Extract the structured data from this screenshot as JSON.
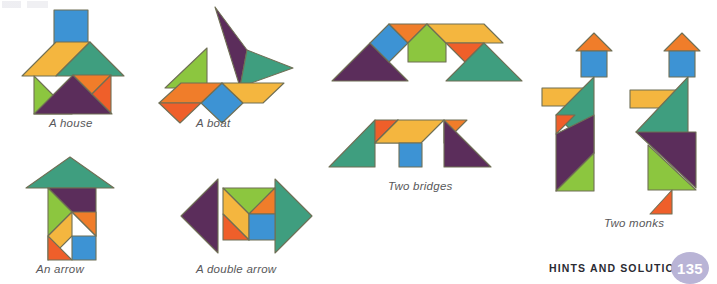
{
  "page": {
    "width": 717,
    "height": 280,
    "background": "#ffffff",
    "footer_label": "HINTS AND SOLUTIONS",
    "page_number": "135",
    "page_badge_color": "#b9b4d6",
    "caption_color": "#58585a"
  },
  "palette": {
    "blue": "#3d93d4",
    "orange": "#f07d2a",
    "orange_dark": "#ef5f2a",
    "yellow": "#f4b63f",
    "green_light": "#8cc63f",
    "green_teal": "#3f9e7f",
    "purple": "#5b2d5b",
    "stroke": "#6f6f55"
  },
  "figures": [
    {
      "id": "house",
      "caption": "A house",
      "pieces": [
        {
          "name": "square-chimney",
          "color": "blue"
        },
        {
          "name": "parallelogram-left-roof",
          "color": "yellow"
        },
        {
          "name": "large-triangle-right-roof",
          "color": "green_teal"
        },
        {
          "name": "medium-triangle-left-wall",
          "color": "green_light"
        },
        {
          "name": "large-triangle-body",
          "color": "purple"
        },
        {
          "name": "small-triangle-upper-right",
          "color": "orange"
        },
        {
          "name": "small-triangle-lower-right",
          "color": "orange_dark"
        }
      ]
    },
    {
      "id": "boat",
      "caption": "A boat",
      "pieces": [
        {
          "name": "large-triangle-sail",
          "color": "purple"
        },
        {
          "name": "large-triangle-sail-right",
          "color": "green_teal"
        },
        {
          "name": "medium-triangle-small-sail",
          "color": "green_light"
        },
        {
          "name": "square-hull-center",
          "color": "blue"
        },
        {
          "name": "parallelogram-hull-left",
          "color": "orange"
        },
        {
          "name": "small-triangle-hull-left",
          "color": "orange_dark"
        },
        {
          "name": "parallelogram-hull-right",
          "color": "yellow"
        }
      ]
    },
    {
      "id": "bridge-top",
      "caption": "",
      "pieces": [
        {
          "name": "large-triangle-left",
          "color": "purple"
        },
        {
          "name": "square-left",
          "color": "blue"
        },
        {
          "name": "small-triangle-left-top",
          "color": "orange"
        },
        {
          "name": "medium-triangle-center",
          "color": "green_light"
        },
        {
          "name": "parallelogram-right-top",
          "color": "yellow"
        },
        {
          "name": "small-triangle-right",
          "color": "orange_dark"
        },
        {
          "name": "large-triangle-right",
          "color": "green_teal"
        }
      ]
    },
    {
      "id": "bridge-bottom",
      "caption": "Two bridges",
      "pieces": [
        {
          "name": "large-triangle-left",
          "color": "green_teal"
        },
        {
          "name": "small-triangle-left-top",
          "color": "orange_dark"
        },
        {
          "name": "medium-triangle-center",
          "color": "green_light"
        },
        {
          "name": "parallelogram-center-top",
          "color": "yellow"
        },
        {
          "name": "small-triangle-right-top",
          "color": "orange"
        },
        {
          "name": "square-center-leg",
          "color": "blue"
        },
        {
          "name": "large-triangle-right",
          "color": "purple"
        }
      ]
    },
    {
      "id": "arrow",
      "caption": "An arrow",
      "pieces": [
        {
          "name": "large-triangle-head",
          "color": "green_teal"
        },
        {
          "name": "large-triangle-body",
          "color": "purple"
        },
        {
          "name": "medium-triangle-left",
          "color": "green_light"
        },
        {
          "name": "parallelogram-lower-left",
          "color": "yellow"
        },
        {
          "name": "small-triangle-bottom-left",
          "color": "orange_dark"
        },
        {
          "name": "small-triangle-right",
          "color": "orange"
        },
        {
          "name": "square-bottom-right",
          "color": "blue"
        }
      ]
    },
    {
      "id": "double-arrow",
      "caption": "A double arrow",
      "pieces": [
        {
          "name": "large-triangle-left-head",
          "color": "purple"
        },
        {
          "name": "large-triangle-right-head",
          "color": "green_teal"
        },
        {
          "name": "medium-triangle-top",
          "color": "green_light"
        },
        {
          "name": "parallelogram-left",
          "color": "yellow"
        },
        {
          "name": "small-triangle-top-right",
          "color": "orange"
        },
        {
          "name": "small-triangle-bottom-left",
          "color": "orange_dark"
        },
        {
          "name": "square-bottom-right",
          "color": "blue"
        }
      ]
    },
    {
      "id": "monk-left",
      "caption": "",
      "pieces": [
        {
          "name": "small-triangle-hat",
          "color": "orange"
        },
        {
          "name": "square-head",
          "color": "blue"
        },
        {
          "name": "parallelogram-arm",
          "color": "yellow"
        },
        {
          "name": "large-triangle-torso",
          "color": "green_teal"
        },
        {
          "name": "small-triangle-hand",
          "color": "orange_dark"
        },
        {
          "name": "large-triangle-robe",
          "color": "purple"
        },
        {
          "name": "medium-triangle-foot",
          "color": "green_light"
        }
      ]
    },
    {
      "id": "monk-right",
      "caption": "Two monks",
      "pieces": [
        {
          "name": "small-triangle-hat",
          "color": "orange"
        },
        {
          "name": "square-head",
          "color": "blue"
        },
        {
          "name": "parallelogram-arm",
          "color": "yellow"
        },
        {
          "name": "large-triangle-torso",
          "color": "green_teal"
        },
        {
          "name": "large-triangle-robe",
          "color": "purple"
        },
        {
          "name": "medium-triangle-leg",
          "color": "green_light"
        },
        {
          "name": "small-triangle-foot",
          "color": "orange_dark"
        }
      ]
    }
  ],
  "captions": {
    "house": "A house",
    "boat": "A boat",
    "two_bridges": "Two bridges",
    "arrow": "An arrow",
    "double_arrow": "A double arrow",
    "two_monks": "Two monks"
  }
}
